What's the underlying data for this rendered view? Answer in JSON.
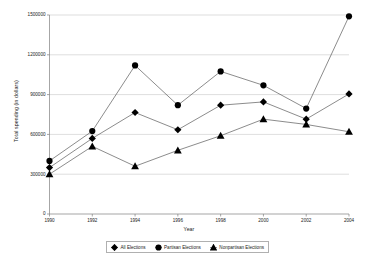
{
  "chart_data": {
    "type": "line",
    "title": "",
    "xlabel": "Year",
    "ylabel": "Total spending (in dollars)",
    "x": [
      1990,
      1992,
      1994,
      1996,
      1998,
      2000,
      2002,
      2004
    ],
    "xtick_labels": [
      "1990",
      "1992",
      "1994",
      "1996",
      "1998",
      "2000",
      "2002",
      "2004"
    ],
    "ytick_labels": [
      "0",
      "300000",
      "600000",
      "900000",
      "1200000",
      "1500000"
    ],
    "ytick_values": [
      0,
      300000,
      600000,
      900000,
      1200000,
      1500000
    ],
    "ylim": [
      0,
      1500000
    ],
    "xlim": [
      1990,
      2004
    ],
    "grid": "horizontal",
    "legend_position": "bottom",
    "series": [
      {
        "name": "All Elections",
        "marker": "diamond",
        "values": [
          350000,
          570000,
          765000,
          635000,
          820000,
          845000,
          715000,
          905000
        ]
      },
      {
        "name": "Partisan Elections",
        "marker": "circle",
        "values": [
          400000,
          625000,
          1120000,
          820000,
          1075000,
          970000,
          795000,
          1490000
        ]
      },
      {
        "name": "Nonpartisan Elections",
        "marker": "triangle",
        "values": [
          300000,
          510000,
          360000,
          480000,
          590000,
          715000,
          675000,
          620000
        ]
      }
    ],
    "colors": {
      "series_line": "#4d4d4d",
      "marker": "#000000",
      "gridline": "#c8c8c8",
      "axis": "#808080",
      "text": "#1a1a1a",
      "background": "#ffffff"
    }
  },
  "legend": {
    "items": [
      {
        "label": "All Elections",
        "marker": "diamond"
      },
      {
        "label": "Partisan Elections",
        "marker": "circle"
      },
      {
        "label": "Nonpartisan Elections",
        "marker": "triangle"
      }
    ]
  }
}
